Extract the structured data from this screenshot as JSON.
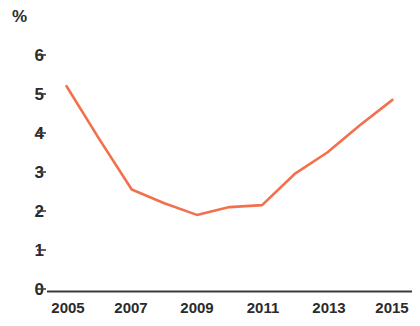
{
  "chart_data": {
    "type": "line",
    "title": "",
    "subtitle": "",
    "xlabel": "",
    "ylabel": "%",
    "unit_label": "%",
    "x": [
      2005,
      2006,
      2007,
      2008,
      2009,
      2010,
      2011,
      2012,
      2013,
      2014,
      2015
    ],
    "values": [
      5.2,
      3.85,
      2.55,
      2.2,
      1.9,
      2.1,
      2.15,
      2.95,
      3.5,
      4.2,
      4.85
    ],
    "series": [
      {
        "name": "",
        "color": "#F2714C",
        "values": [
          5.2,
          3.85,
          2.55,
          2.2,
          1.9,
          2.1,
          2.15,
          2.95,
          3.5,
          4.2,
          4.85
        ]
      }
    ],
    "categories": [
      "2005",
      "2006",
      "2007",
      "2008",
      "2009",
      "2010",
      "2011",
      "2012",
      "2013",
      "2014",
      "2015"
    ],
    "xtick_labels": [
      "2005",
      "2007",
      "2009",
      "2011",
      "2013",
      "2015"
    ],
    "xtick_values": [
      2005,
      2007,
      2009,
      2011,
      2013,
      2015
    ],
    "ytick_labels": [
      "6",
      "5",
      "4",
      "3",
      "2",
      "1",
      "0"
    ],
    "ytick_values": [
      6,
      5,
      4,
      3,
      2,
      1,
      0
    ],
    "xlim": [
      2004.4,
      2015.6
    ],
    "ylim": [
      0,
      6
    ],
    "grid": false,
    "legend": "none",
    "line_color": "#F2714C",
    "axis_color": "#3a3a3a",
    "text_color": "#2b2b2b",
    "background": "#ffffff"
  }
}
